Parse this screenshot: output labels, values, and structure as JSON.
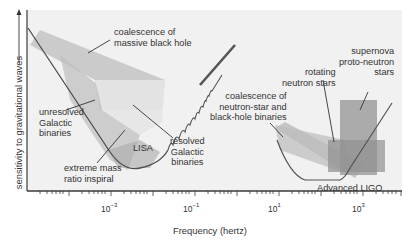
{
  "figure": {
    "y_axis_label": "sensitivity to gravitational waves",
    "x_axis_label": "Frequency (hertz)",
    "x_ticks": [
      {
        "base": "10",
        "exp": "−3"
      },
      {
        "base": "10",
        "exp": "−1"
      },
      {
        "base": "10",
        "exp": "1"
      },
      {
        "base": "10",
        "exp": "3"
      }
    ],
    "detectors": [
      {
        "name": "LISA",
        "label": "LISA"
      },
      {
        "name": "Advanced LIGO",
        "label": "Advanced LIGO"
      }
    ],
    "sources": {
      "massive_bh": [
        "coalescence of",
        "massive black hole"
      ],
      "unresolved": [
        "unresolved",
        "Galactic",
        "binaries"
      ],
      "resolved": [
        "resolved",
        "Galactic",
        "binaries"
      ],
      "emri": [
        "extreme mass",
        "ratio inspiral"
      ],
      "ns_bh": [
        "coalescence of",
        "neutron-star and",
        "black-hole binaries"
      ],
      "rotating_ns": [
        "rotating",
        "neutron stars"
      ],
      "supernova": [
        "supernova",
        "proto-neutron",
        "stars"
      ]
    },
    "colors": {
      "plot_bg": "#f1f1f1",
      "axis": "#3a3a3a",
      "band_light": "#c9c9c9",
      "band_mid": "#b3b3b3",
      "band_dark": "#9a9a9a",
      "curve": "#555555"
    }
  }
}
